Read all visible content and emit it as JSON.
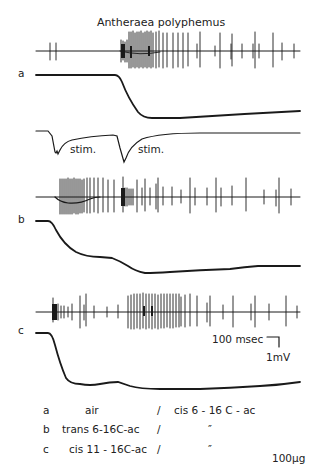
{
  "figure": {
    "title": "Antheraea polyphemus",
    "ink_color": "#1a1a1a",
    "background": "#ffffff"
  },
  "traces": [
    {
      "label": "a",
      "description": "spike recording and receptor potential, stimulus a"
    },
    {
      "label": "b",
      "description": "spike recording and receptor potential, stimulus b"
    },
    {
      "label": "c",
      "description": "spike recording and receptor potential, stimulus c"
    }
  ],
  "stimulus_markers": [
    {
      "label": "stim."
    },
    {
      "label": "stim."
    }
  ],
  "scale_bar": {
    "time": "100 msec",
    "voltage": "1mV"
  },
  "legend": {
    "rows": [
      {
        "key": "a",
        "first": "air",
        "sep": "/",
        "second": "cis 6 - 16 C - ac"
      },
      {
        "key": "b",
        "first": "trans 6-16C-ac",
        "sep": "/",
        "second": "″"
      },
      {
        "key": "c",
        "first": "cis 11 - 16C-ac",
        "sep": "/",
        "second": "″"
      }
    ],
    "dose": "100µg"
  }
}
